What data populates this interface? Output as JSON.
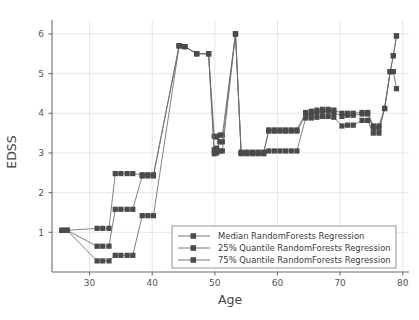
{
  "chart_data": {
    "type": "line",
    "title": "",
    "xlabel": "Age",
    "ylabel": "EDSS",
    "xlim": [
      24,
      81
    ],
    "ylim": [
      0.0,
      6.35
    ],
    "xticks": [
      30,
      40,
      50,
      60,
      70,
      80
    ],
    "yticks": [
      1,
      2,
      3,
      4,
      5,
      6
    ],
    "grid": true,
    "legend_position": "lower right",
    "marker": "square",
    "series": [
      {
        "name": "Median RandomForests Regression",
        "color": "#4a4a4a",
        "x": [
          25.6,
          26.4,
          31.2,
          32.1,
          33.1,
          34.1,
          35.0,
          36.0,
          36.9,
          38.4,
          39.3,
          40.2,
          44.3,
          45.2,
          47.1,
          49.0,
          49.9,
          50.3,
          50.8,
          51.2,
          53.3,
          54.2,
          55.1,
          56.0,
          56.9,
          57.8,
          58.6,
          59.5,
          60.4,
          61.3,
          62.2,
          63.1,
          64.5,
          65.4,
          66.3,
          67.2,
          68.1,
          69.0,
          70.3,
          71.2,
          72.1,
          73.5,
          74.4,
          75.3,
          76.2,
          77.1,
          78.0,
          78.5,
          79.0
        ],
        "y": [
          1.05,
          1.05,
          1.1,
          1.1,
          1.1,
          2.48,
          2.48,
          2.48,
          2.48,
          2.45,
          2.45,
          2.45,
          5.7,
          5.68,
          5.5,
          5.5,
          3.42,
          3.4,
          3.45,
          3.45,
          6.0,
          3.0,
          3.0,
          3.0,
          3.0,
          3.0,
          3.55,
          3.55,
          3.55,
          3.55,
          3.55,
          3.55,
          3.95,
          3.98,
          4.02,
          4.05,
          4.05,
          4.02,
          3.92,
          3.95,
          3.95,
          3.98,
          3.98,
          3.62,
          3.62,
          4.12,
          5.05,
          5.45,
          5.95
        ]
      },
      {
        "name": "25% Quantile RandomForests Regression",
        "color": "#4a4a4a",
        "x": [
          25.6,
          26.4,
          31.2,
          32.1,
          33.1,
          34.1,
          35.0,
          36.0,
          36.9,
          38.4,
          39.3,
          40.2,
          44.3,
          45.2,
          47.1,
          49.0,
          49.9,
          50.3,
          50.8,
          51.2,
          53.3,
          54.2,
          55.1,
          56.0,
          56.9,
          57.8,
          58.6,
          59.5,
          60.4,
          61.3,
          62.2,
          63.1,
          64.5,
          65.4,
          66.3,
          67.2,
          68.1,
          69.0,
          70.3,
          71.2,
          72.1,
          73.5,
          74.4,
          75.3,
          76.2,
          77.1,
          78.0,
          78.5,
          79.0
        ],
        "y": [
          1.05,
          1.05,
          0.28,
          0.28,
          0.28,
          0.42,
          0.42,
          0.42,
          0.42,
          1.42,
          1.42,
          1.42,
          5.7,
          5.68,
          5.5,
          5.5,
          2.98,
          3.0,
          3.05,
          3.05,
          6.0,
          2.98,
          2.98,
          2.98,
          2.98,
          2.98,
          3.05,
          3.05,
          3.05,
          3.05,
          3.05,
          3.05,
          3.88,
          3.88,
          3.9,
          3.92,
          3.92,
          3.9,
          3.68,
          3.7,
          3.7,
          3.82,
          3.82,
          3.5,
          3.5,
          4.12,
          5.05,
          5.45,
          5.95
        ]
      },
      {
        "name": "75% Quantile RandomForests Regression",
        "color": "#4a4a4a",
        "x": [
          25.6,
          26.4,
          31.2,
          32.1,
          33.1,
          34.1,
          35.0,
          36.0,
          36.9,
          38.4,
          39.3,
          40.2,
          44.3,
          45.2,
          47.1,
          49.0,
          49.9,
          50.3,
          50.8,
          51.2,
          53.3,
          54.2,
          55.1,
          56.0,
          56.9,
          57.8,
          58.6,
          59.5,
          60.4,
          61.3,
          62.2,
          63.1,
          64.5,
          65.4,
          66.3,
          67.2,
          68.1,
          69.0,
          70.3,
          71.2,
          72.1,
          73.5,
          74.4,
          75.3,
          76.2,
          77.1,
          78.0,
          78.5,
          79.0
        ],
        "y": [
          1.05,
          1.05,
          0.65,
          0.65,
          0.65,
          1.58,
          1.58,
          1.58,
          1.58,
          2.42,
          2.42,
          2.42,
          5.7,
          5.68,
          5.5,
          5.5,
          3.08,
          3.12,
          3.28,
          3.28,
          6.0,
          3.02,
          3.02,
          3.02,
          3.02,
          3.02,
          3.58,
          3.58,
          3.58,
          3.58,
          3.58,
          3.58,
          4.02,
          4.05,
          4.08,
          4.1,
          4.1,
          4.08,
          4.0,
          4.0,
          4.0,
          4.02,
          4.02,
          3.68,
          3.68,
          4.12,
          5.05,
          5.05,
          4.62
        ]
      }
    ],
    "legend_entries": [
      "Median RandomForests Regression",
      "25% Quantile RandomForests Regression",
      "75% Quantile RandomForests Regression"
    ]
  },
  "colors": {
    "marker": "#4a4a4a",
    "line": "#6a6a6a",
    "axis": "#6d6d6d",
    "grid": "#dcdcdc",
    "text": "#444444",
    "legend_border": "#8a8a8a"
  }
}
